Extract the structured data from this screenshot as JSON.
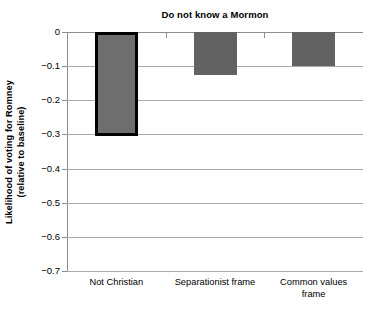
{
  "chart_data": {
    "type": "bar",
    "title": "Do not know a Mormon",
    "xlabel": "",
    "ylabel_line1": "Likelihood of voting for Romney",
    "ylabel_line2": "(relative to baseline)",
    "categories": [
      "Not Christian",
      "Separationist frame",
      "Common values frame"
    ],
    "values": [
      -0.305,
      -0.125,
      -0.1
    ],
    "series": [
      {
        "name": "Likelihood of voting for Romney (relative to baseline)",
        "values": [
          -0.305,
          -0.125,
          -0.1
        ]
      }
    ],
    "ylim": [
      -0.7,
      0
    ],
    "ytick_labels": [
      "0",
      "-0.1",
      "-0.2",
      "-0.3",
      "-0.4",
      "-0.5",
      "-0.6",
      "-0.7"
    ],
    "ytick_values": [
      0,
      -0.1,
      -0.2,
      -0.3,
      -0.4,
      -0.5,
      -0.6,
      -0.7
    ],
    "grid": true,
    "legend": "none",
    "bar_color": "#626262",
    "highlight_bar_index": 0,
    "highlight_border_color": "#000000",
    "gridline_color": "#a9a9a9",
    "axis_color": "#8e8e8e",
    "background": "#ffffff"
  }
}
